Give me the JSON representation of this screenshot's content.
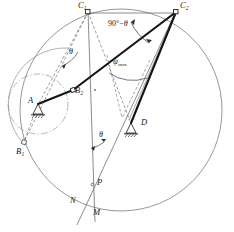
{
  "figure": {
    "background_color": "#ffffff",
    "line_color": "#3c3c3c",
    "thick_link_color": "#1a1a1a",
    "label_color": "#1a1a1a",
    "width": 234,
    "height": 232
  },
  "points": {
    "A": {
      "label": "A",
      "sub": "",
      "x": 38,
      "y": 104
    },
    "B1": {
      "label": "B",
      "sub": "1",
      "x": 23,
      "y": 143
    },
    "B2": {
      "label": "B",
      "sub": "2",
      "x": 73,
      "y": 92
    },
    "C1": {
      "label": "C",
      "sub": "1",
      "x": 88,
      "y": 11
    },
    "C2": {
      "label": "C",
      "sub": "2",
      "x": 176,
      "y": 11
    },
    "D": {
      "label": "D",
      "sub": "",
      "x": 131,
      "y": 124
    },
    "P": {
      "label": "P",
      "sub": "",
      "x": 96,
      "y": 184
    },
    "N": {
      "label": "N",
      "sub": "",
      "x": 74,
      "y": 201
    },
    "M": {
      "label": "M",
      "sub": "",
      "x": 97,
      "y": 213
    }
  },
  "annotations": {
    "theta_upper": {
      "text": "θ",
      "x": 71,
      "y": 53
    },
    "theta_lower": {
      "text": "θ",
      "x": 101,
      "y": 136
    },
    "ninety_minus_theta": {
      "prefix": "90",
      "degree": "°",
      "minus": "−",
      "theta": "θ",
      "x": 112,
      "y": 26
    },
    "psi_max": {
      "symbol": "ψ",
      "subscript": "max",
      "x": 116,
      "y": 64
    }
  },
  "geometry": {
    "big_circle": {
      "cx": 121,
      "cy": 110,
      "r": 101,
      "style": "solid"
    },
    "crank_circle": {
      "cx": 38,
      "cy": 104,
      "r": 30,
      "style": "dash-dot"
    },
    "arc_B_path": {
      "style": "solid",
      "description": "arc through B1 and B2 about A"
    },
    "links": [
      {
        "name": "crank-A-B2",
        "from": "A",
        "to": "B2",
        "style": "thick"
      },
      {
        "name": "coupler-B2-C2",
        "from": "B2",
        "to": "C2",
        "style": "thick"
      },
      {
        "name": "rocker-D-C2",
        "from": "D",
        "to": "C2",
        "style": "thick"
      },
      {
        "name": "chord-C1-C2",
        "from": "C1",
        "to": "C2",
        "style": "thin"
      },
      {
        "name": "dashed-C1-A",
        "from": "C1",
        "to": "A",
        "style": "dashed"
      },
      {
        "name": "dashed-C1-B1",
        "from": "C1",
        "to": "B1",
        "style": "dashed"
      },
      {
        "name": "dashed-C1-D",
        "from": "C1",
        "to": "D",
        "style": "dashed"
      },
      {
        "name": "vertical-C1-M",
        "from": "C1",
        "to": "M",
        "style": "thin"
      },
      {
        "name": "oblique-C2-N",
        "from": "C2",
        "to": "N",
        "style": "thin"
      },
      {
        "name": "thin-C2-D-aux",
        "from": "C2",
        "to": "D",
        "style": "thin"
      }
    ],
    "supports": [
      {
        "name": "ground-pivot-A",
        "x": 38,
        "y": 104
      },
      {
        "name": "ground-pivot-D",
        "x": 131,
        "y": 124
      }
    ]
  }
}
